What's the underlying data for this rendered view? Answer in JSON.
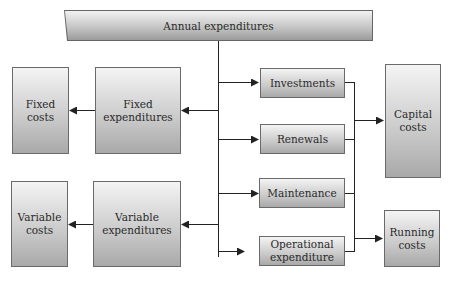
{
  "diagram": {
    "title": "Annual expenditures",
    "left_column": {
      "fixed_costs": [
        "Fixed",
        "costs"
      ],
      "fixed_expenditures": [
        "Fixed",
        "expenditures"
      ],
      "variable_costs": [
        "Variable",
        "costs"
      ],
      "variable_expenditures": [
        "Variable",
        "expenditures"
      ]
    },
    "middle_column": {
      "investments": "Investments",
      "renewals": "Renewals",
      "maintenance": "Maintenance",
      "operational_expenditure": [
        "Operational",
        "expenditure"
      ]
    },
    "right_column": {
      "capital_costs": [
        "Capital",
        "costs"
      ],
      "running_costs": [
        "Running",
        "costs"
      ]
    },
    "colors": {
      "line": "#222222",
      "box_border": "#6a6a6a",
      "gradient_top": "#f4f4f4",
      "gradient_bottom": "#a9a9a9"
    }
  }
}
